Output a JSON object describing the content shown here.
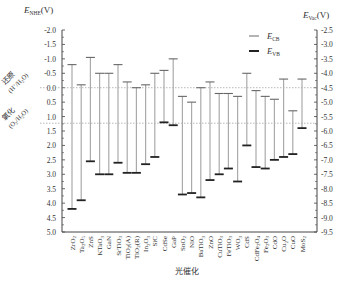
{
  "chart_data": {
    "type": "range-bar",
    "title": "",
    "xlabel": "光催化",
    "ylabel_left": "E_NHE(V)",
    "ylabel_left_main": "E",
    "ylabel_left_sub": "NHE",
    "ylabel_left_unit": "(V)",
    "ylabel_right": "E_Vac(V)",
    "ylabel_right_main": "E",
    "ylabel_right_sub": "Vac",
    "ylabel_right_unit": "(V)",
    "ylim_left": [
      -2.0,
      5.0
    ],
    "ylim_right": [
      -2.5,
      -9.5
    ],
    "left_ticks": [
      "-2.0",
      "-1.5",
      "-1.0",
      "-0.5",
      "0.0",
      "0.5",
      "1.0",
      "1.5",
      "2.0",
      "2.5",
      "3.0",
      "3.5",
      "4.0",
      "4.5",
      "5.0"
    ],
    "right_ticks": [
      "-2.5",
      "-3.0",
      "-3.5",
      "-4.0",
      "-4.5",
      "-5.0",
      "-5.5",
      "-6.0",
      "-6.5",
      "-7.0",
      "-7.5",
      "-8.0",
      "-8.5",
      "-9.0",
      "-9.5"
    ],
    "reference_lines": [
      {
        "value": 0.0,
        "label_top": "还原",
        "label_bottom": "(H+/H2O)",
        "label_bottom_main": "(H",
        "label_bottom_sup": "+",
        "label_bottom_rest": "/H",
        "label_bottom_sub": "2",
        "label_bottom_end": "O)"
      },
      {
        "value": 1.23,
        "label_top": "氧化",
        "label_bottom": "(O2/H2O)",
        "label_bottom_main": "(O",
        "label_bottom_sup": "",
        "label_bottom_rest": "/H",
        "label_bottom_sub": "2",
        "label_bottom_end": "O)"
      }
    ],
    "legend": [
      {
        "name": "E_CB",
        "main": "E",
        "sub": "CB",
        "style": "thin"
      },
      {
        "name": "E_VB",
        "main": "E",
        "sub": "VB",
        "style": "thick"
      }
    ],
    "legend_position": "upper right",
    "grid": false,
    "categories": [
      "ZrO2",
      "Ta2O5",
      "ZnS",
      "KTaO3",
      "GaN",
      "SrTiO3",
      "TiO2(A)",
      "TiO2(R)",
      "In2O3",
      "SiC",
      "CdSe",
      "GaP",
      "SnO2",
      "NiO",
      "BaTiO3",
      "ZnO",
      "CuTiO3",
      "FeTiO3",
      "WO3",
      "CdS",
      "CdFe2O4",
      "Fe2O3",
      "CdO",
      "Cu2O",
      "CuO",
      "MoS2"
    ],
    "series": [
      {
        "name": "E_CB",
        "values": [
          -0.8,
          -0.1,
          -1.05,
          -0.5,
          -0.5,
          -0.8,
          -0.2,
          0.0,
          -0.1,
          -0.5,
          -0.6,
          -1.0,
          0.3,
          0.5,
          0.0,
          -0.2,
          0.2,
          0.2,
          0.3,
          -0.5,
          0.1,
          0.3,
          0.4,
          -0.3,
          0.8,
          -0.3
        ]
      },
      {
        "name": "E_VB",
        "values": [
          4.2,
          3.9,
          2.55,
          3.0,
          3.0,
          2.6,
          2.95,
          2.95,
          2.65,
          2.4,
          1.2,
          1.3,
          3.7,
          3.65,
          3.8,
          3.2,
          3.0,
          2.8,
          3.25,
          2.0,
          2.75,
          2.8,
          2.5,
          2.4,
          2.3,
          1.4
        ]
      }
    ]
  }
}
